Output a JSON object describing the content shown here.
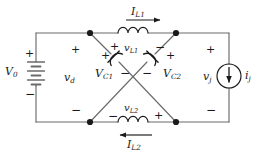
{
  "figure": {
    "name": "z-source-network-circuit",
    "type": "schematic",
    "stroke_color": "#6b6b6b",
    "text_color": "#1a1a1a",
    "background": "#ffffff"
  },
  "components": {
    "source_dc": {
      "symbol": "battery",
      "label": "V",
      "subscript": "0",
      "plus": "+",
      "minus": "−"
    },
    "inductor_top": {
      "symbol": "inductor-coil",
      "voltage_label": "v",
      "voltage_subscript": "L1",
      "voltage_plus": "+",
      "voltage_minus": "−",
      "current_label": "I",
      "current_subscript": "L1",
      "current_direction": "right"
    },
    "inductor_bottom": {
      "symbol": "inductor-coil",
      "voltage_label": "v",
      "voltage_subscript": "L2",
      "voltage_plus": "+",
      "voltage_minus": "−",
      "current_label": "I",
      "current_subscript": "L2",
      "current_direction": "left"
    },
    "capacitor_left": {
      "symbol": "capacitor-polarized",
      "label": "V",
      "subscript": "C1",
      "plus": "+",
      "minus": "−"
    },
    "capacitor_right": {
      "symbol": "capacitor-polarized",
      "label": "V",
      "subscript": "C2",
      "plus": "+",
      "minus": "−"
    },
    "node_voltage_left": {
      "label": "v",
      "subscript": "d",
      "plus": "+",
      "minus": "−"
    },
    "source_current": {
      "symbol": "current-source-circle",
      "current_label": "i",
      "current_subscript": "j",
      "voltage_label": "v",
      "voltage_subscript": "j",
      "voltage_plus": "+",
      "voltage_minus": "−",
      "arrow_direction": "down"
    }
  },
  "nodes": [
    {
      "name": "node-top-left",
      "x": 90,
      "y": 33
    },
    {
      "name": "node-top-right",
      "x": 176,
      "y": 33
    },
    {
      "name": "node-bottom-left",
      "x": 90,
      "y": 122
    },
    {
      "name": "node-bottom-right",
      "x": 176,
      "y": 122
    }
  ]
}
